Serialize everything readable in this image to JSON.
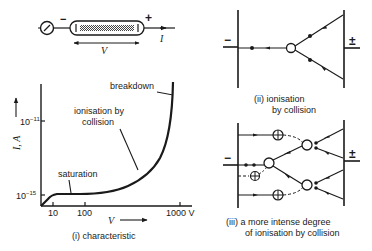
{
  "tube": {
    "minus": "−",
    "plus": "+",
    "voltage_label": "V",
    "current_label": "I"
  },
  "graph": {
    "y_axis_label": "I, A",
    "y_ticks": [
      {
        "base": "10",
        "exp": "−11"
      },
      {
        "base": "10",
        "exp": "−15"
      }
    ],
    "x_ticks": [
      "10",
      "100",
      "1000 V"
    ],
    "x_axis_label": "V",
    "annotations": {
      "breakdown": "breakdown",
      "ionisation_line1": "ionisation by",
      "ionisation_line2": "collision",
      "saturation": "saturation"
    },
    "caption": "(i) characteristic"
  },
  "panel2": {
    "minus": "−",
    "plus": "±",
    "caption_line1": "(ii) ionisation",
    "caption_line2": "by collision"
  },
  "panel3": {
    "minus": "−",
    "plus": "±",
    "caption_line1": "(iii) a more intense degree",
    "caption_line2": "of ionisation by collision"
  }
}
